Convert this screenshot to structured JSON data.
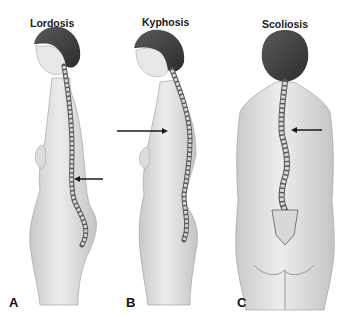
{
  "panels": [
    {
      "letter": "A",
      "title": "Lordosis",
      "view": "side",
      "arrow_direction": "left"
    },
    {
      "letter": "B",
      "title": "Kyphosis",
      "view": "side",
      "arrow_direction": "right"
    },
    {
      "letter": "C",
      "title": "Scoliosis",
      "view": "back",
      "arrow_direction": "left"
    }
  ],
  "colors": {
    "skin": "#e6e6e6",
    "skin_shade": "#bdbdbd",
    "hair": "#3f3f3f",
    "spine_dark": "#5a5a5a",
    "vertebra": "#d8d8d8",
    "arrow": "#1a1a1a"
  }
}
